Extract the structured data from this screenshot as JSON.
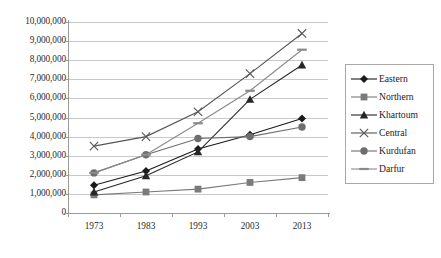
{
  "chart_data": {
    "type": "line",
    "title": "",
    "xlabel": "",
    "ylabel": "",
    "categories": [
      "1973",
      "1983",
      "1993",
      "2003",
      "2013"
    ],
    "ylim": [
      0,
      10000000
    ],
    "ytick_step": 1000000,
    "ytick_labels": [
      "10,000,000",
      "9,000,000",
      "8,000,000",
      "7,000,000",
      "6,000,000",
      "5,000,000",
      "4,000,000",
      "3,000,000",
      "2,000,000",
      "1,000,000",
      "0"
    ],
    "grid": "horizontal",
    "legend_position": "right",
    "series": [
      {
        "name": "Eastern",
        "marker": "diamond",
        "color": "#1a1a1a",
        "values": [
          1450000,
          2200000,
          3350000,
          4100000,
          4950000
        ]
      },
      {
        "name": "Northern",
        "marker": "square",
        "color": "#7a7a7a",
        "values": [
          950000,
          1100000,
          1250000,
          1600000,
          1850000
        ]
      },
      {
        "name": "Khartoum",
        "marker": "triangle",
        "color": "#262626",
        "values": [
          1100000,
          1950000,
          3200000,
          5950000,
          7750000
        ]
      },
      {
        "name": "Central",
        "marker": "x",
        "color": "#555555",
        "values": [
          3500000,
          4000000,
          5300000,
          7300000,
          9400000
        ]
      },
      {
        "name": "Kurdufan",
        "marker": "circle",
        "color": "#6e6e6e",
        "values": [
          2100000,
          3050000,
          3900000,
          4000000,
          4500000
        ]
      },
      {
        "name": "Darfur",
        "marker": "dash",
        "color": "#8a8a8a",
        "values": [
          2100000,
          3050000,
          4700000,
          6400000,
          8550000
        ]
      }
    ]
  },
  "legend": {
    "items": [
      {
        "label": "Eastern"
      },
      {
        "label": "Northern"
      },
      {
        "label": "Khartoum"
      },
      {
        "label": "Central"
      },
      {
        "label": "Kurdufan"
      },
      {
        "label": "Darfur"
      }
    ]
  }
}
